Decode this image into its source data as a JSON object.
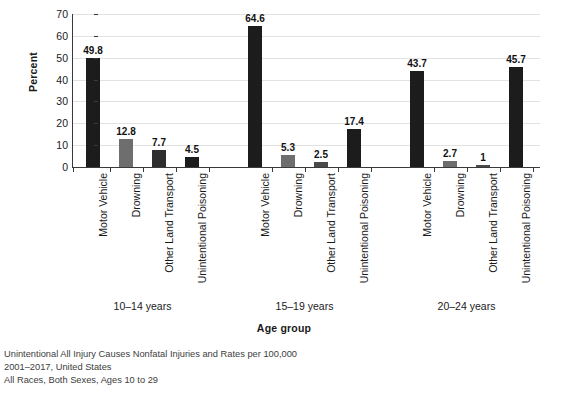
{
  "chart_data": {
    "type": "bar",
    "title": "",
    "xlabel": "Age group",
    "ylabel": "Percent",
    "ylim": [
      0,
      70
    ],
    "ytick_step": 10,
    "yticks": [
      70,
      60,
      50,
      40,
      30,
      20,
      10,
      0
    ],
    "grid": true,
    "legend": "none",
    "categories": [
      "Motor Vehicle",
      "Drowning",
      "Other Land Transport",
      "Unintentional Poisoning"
    ],
    "groups": [
      {
        "label": "10–14 years",
        "bars": [
          {
            "category": "Motor Vehicle",
            "value": 49.8,
            "value_label": "49.8",
            "color": "#1c1c1c"
          },
          {
            "category": "Drowning",
            "value": 12.8,
            "value_label": "12.8",
            "color": "#6e6e6e"
          },
          {
            "category": "Other Land Transport",
            "value": 7.7,
            "value_label": "7.7",
            "color": "#2e2e2e"
          },
          {
            "category": "Unintentional Poisoning",
            "value": 4.5,
            "value_label": "4.5",
            "color": "#1c1c1c"
          }
        ]
      },
      {
        "label": "15–19 years",
        "bars": [
          {
            "category": "Motor Vehicle",
            "value": 64.6,
            "value_label": "64.6",
            "color": "#1c1c1c"
          },
          {
            "category": "Drowning",
            "value": 5.3,
            "value_label": "5.3",
            "color": "#6e6e6e"
          },
          {
            "category": "Other Land Transport",
            "value": 2.5,
            "value_label": "2.5",
            "color": "#4a4a4a"
          },
          {
            "category": "Unintentional Poisoning",
            "value": 17.4,
            "value_label": "17.4",
            "color": "#1c1c1c"
          }
        ]
      },
      {
        "label": "20–24 years",
        "bars": [
          {
            "category": "Motor Vehicle",
            "value": 43.7,
            "value_label": "43.7",
            "color": "#1c1c1c"
          },
          {
            "category": "Drowning",
            "value": 2.7,
            "value_label": "2.7",
            "color": "#6e6e6e"
          },
          {
            "category": "Other Land Transport",
            "value": 1.0,
            "value_label": "1",
            "color": "#4a4a4a"
          },
          {
            "category": "Unintentional Poisoning",
            "value": 45.7,
            "value_label": "45.7",
            "color": "#1c1c1c"
          }
        ]
      }
    ]
  },
  "footnote": {
    "lines": [
      "Unintentional All Injury Causes Nonfatal Injuries and Rates per 100,000",
      "2001–2017, United States",
      "All Races, Both Sexes, Ages 10 to 29"
    ]
  },
  "colors": {
    "bar_dark": "#1c1c1c",
    "bar_gray": "#6e6e6e",
    "gridline": "#e2e2e2",
    "axis": "#3a3a3a",
    "text": "#1a1a1a",
    "footnote_text": "#3d3d3d",
    "background": "#ffffff"
  }
}
